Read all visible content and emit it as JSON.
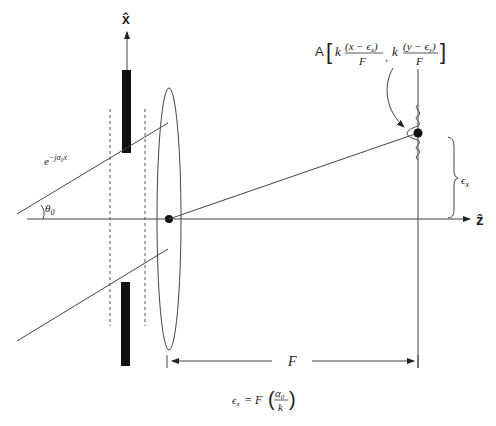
{
  "diagram": {
    "type": "optics-schematic",
    "axes": {
      "x_label": "x̂",
      "z_label": "ẑ"
    },
    "labels": {
      "incident_wave": "e",
      "incident_wave_exp": "−jα₀x",
      "angle": "θ",
      "angle_sub": "0",
      "focal_length": "F",
      "shift": "ϵ",
      "shift_sub": "x",
      "amplitude_prefix": "A",
      "amplitude_k1": "k",
      "amplitude_num1": "(x − ϵ",
      "amplitude_num1_sub": "x",
      "amplitude_num1_close": ")",
      "amplitude_den1": "F",
      "amplitude_sep": ",",
      "amplitude_k2": "k",
      "amplitude_num2": "(y − ϵ",
      "amplitude_num2_sub": "y",
      "amplitude_num2_close": ")",
      "amplitude_den2": "F",
      "equation_lhs": "ϵ",
      "equation_lhs_sub": "x",
      "equation_eq": "= F",
      "equation_num": "α",
      "equation_num_sub": "0",
      "equation_den": "k"
    },
    "colors": {
      "line": "#444444",
      "fill": "#111111",
      "background": "#ffffff"
    }
  }
}
